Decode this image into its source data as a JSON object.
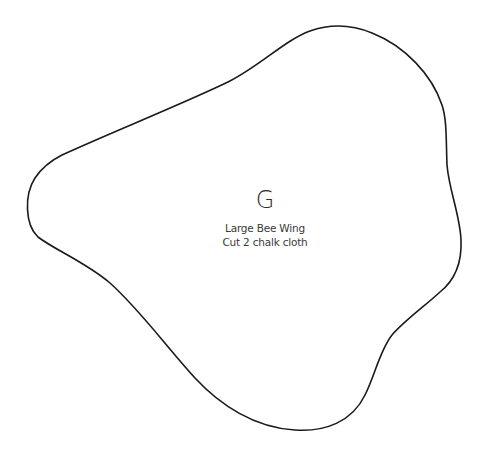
{
  "pattern_piece": {
    "letter": "G",
    "name": "Large Bee Wing",
    "instruction": "Cut 2 chalk cloth",
    "outline_color": "#1a1a1a",
    "background_color": "#ffffff"
  }
}
